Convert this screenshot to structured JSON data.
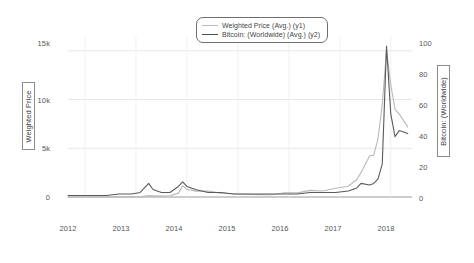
{
  "chart_data": {
    "type": "line",
    "title": "",
    "xlabel": "",
    "grid": true,
    "legend_position": "top-center",
    "x_axis": {
      "tick_labels": [
        "2012",
        "2013",
        "2014",
        "2015",
        "2016",
        "2017",
        "2018"
      ],
      "range": [
        "2011-09",
        "2018-06"
      ]
    },
    "y_axes": [
      {
        "id": "y1",
        "label": "Weighted Price",
        "side": "left",
        "tick_labels": [
          "0",
          "5k",
          "10k",
          "15k"
        ],
        "tick_values": [
          0,
          5000,
          10000,
          15000
        ],
        "ylim": [
          0,
          15800
        ]
      },
      {
        "id": "y2",
        "label": "Bitcoin: (Worldwide)",
        "side": "right",
        "tick_labels": [
          "0",
          "20",
          "40",
          "60",
          "80",
          "100"
        ],
        "tick_values": [
          0,
          20,
          40,
          60,
          80,
          100
        ],
        "ylim": [
          0,
          102
        ]
      }
    ],
    "series": [
      {
        "name": "Weighted Price (Avg.) (y1)",
        "axis": "y1",
        "color": "#b9b9b9",
        "x": [
          "2011-09",
          "2011-12",
          "2012-03",
          "2012-06",
          "2012-09",
          "2012-12",
          "2013-02",
          "2013-04",
          "2013-05",
          "2013-07",
          "2013-09",
          "2013-11",
          "2013-12",
          "2014-01",
          "2014-03",
          "2014-06",
          "2014-09",
          "2014-12",
          "2015-03",
          "2015-06",
          "2015-09",
          "2015-12",
          "2016-03",
          "2016-06",
          "2016-09",
          "2016-12",
          "2017-03",
          "2017-05",
          "2017-06",
          "2017-08",
          "2017-09",
          "2017-10",
          "2017-11",
          "2017-12",
          "2018-01",
          "2018-02",
          "2018-03",
          "2018-05"
        ],
        "values": [
          5,
          4,
          5,
          7,
          12,
          13,
          30,
          140,
          120,
          90,
          130,
          400,
          1150,
          800,
          600,
          600,
          400,
          330,
          260,
          240,
          235,
          430,
          420,
          680,
          610,
          900,
          1100,
          1800,
          2500,
          4200,
          4300,
          6000,
          9500,
          15000,
          11500,
          9000,
          8500,
          7200
        ]
      },
      {
        "name": "Bitcoin: (Worldwide) (Avg.) (y2)",
        "axis": "y2",
        "color": "#5a5a5a",
        "x": [
          "2011-09",
          "2011-12",
          "2012-03",
          "2012-06",
          "2012-09",
          "2012-12",
          "2013-02",
          "2013-04",
          "2013-05",
          "2013-07",
          "2013-09",
          "2013-11",
          "2013-12",
          "2014-01",
          "2014-03",
          "2014-06",
          "2014-09",
          "2014-12",
          "2015-03",
          "2015-06",
          "2015-09",
          "2015-12",
          "2016-03",
          "2016-06",
          "2016-09",
          "2016-12",
          "2017-03",
          "2017-05",
          "2017-06",
          "2017-08",
          "2017-09",
          "2017-10",
          "2017-11",
          "2017-12",
          "2018-01",
          "2018-02",
          "2018-03",
          "2018-05"
        ],
        "values": [
          1,
          1,
          1,
          1,
          2,
          2,
          3,
          9,
          5,
          3,
          3,
          7,
          10,
          7,
          5,
          3,
          3,
          2,
          2,
          2,
          2,
          2,
          2,
          3,
          3,
          3,
          4,
          6,
          9,
          8,
          9,
          12,
          22,
          100,
          55,
          40,
          44,
          42
        ]
      }
    ]
  },
  "legend": {
    "entries": [
      {
        "label": "Weighted Price (Avg.) (y1)",
        "color": "#b9b9b9"
      },
      {
        "label": "Bitcoin: (Worldwide) (Avg.) (y2)",
        "color": "#4f4f4f"
      }
    ]
  },
  "axis_titles": {
    "left": "Weighted Price",
    "right": "Bitcoin: (Worldwide)"
  },
  "left_ticks": [
    "15k",
    "10k",
    "5k",
    "0"
  ],
  "right_ticks": [
    "100",
    "80",
    "60",
    "40",
    "20",
    "0"
  ],
  "x_ticks": [
    "2012",
    "2013",
    "2014",
    "2015",
    "2016",
    "2017",
    "2018"
  ]
}
